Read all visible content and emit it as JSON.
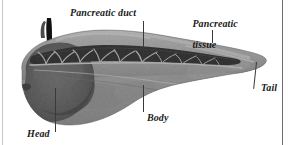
{
  "figure": {
    "type": "anatomical-photograph",
    "background_color": "#ffffff",
    "rendering": "grayscale",
    "labels": [
      {
        "id": "pancreatic-duct",
        "text": "Pancreatic duct",
        "lines": [
          "Pancreatic duct"
        ]
      },
      {
        "id": "pancreatic-tissue",
        "text": "Pancreatic tissue",
        "lines": [
          "Pancreatic",
          "tissue"
        ]
      },
      {
        "id": "tail",
        "text": "Tail",
        "lines": [
          "Tail"
        ]
      },
      {
        "id": "body",
        "text": "Body",
        "lines": [
          "Body"
        ]
      },
      {
        "id": "head",
        "text": "Head",
        "lines": [
          "Head"
        ]
      }
    ],
    "structures": [
      {
        "id": "duct-stem",
        "name": "protruding duct stump",
        "tone": "#0e0e0e"
      },
      {
        "id": "duct-lumen",
        "name": "opened main pancreatic duct",
        "tone": "#0a0a0a"
      },
      {
        "id": "duct-branches",
        "name": "branching duct tributaries",
        "tone": "#b9b9b9"
      },
      {
        "id": "parenchyma",
        "name": "pancreatic tissue",
        "tone": "#8f8f8f"
      },
      {
        "id": "head-region",
        "name": "head of pancreas",
        "tone": "#4a4a4a"
      },
      {
        "id": "tail-region",
        "name": "tail of pancreas",
        "tone": "#9a9a9a"
      }
    ],
    "leader_color": "#3a3a3a"
  }
}
